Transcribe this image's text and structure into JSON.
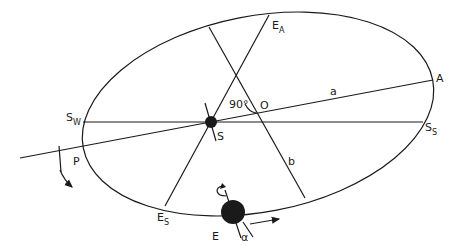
{
  "diagram": {
    "type": "orbital-geometry",
    "labels": {
      "sun": "S",
      "earth": "E",
      "center": "O",
      "aphelion": "A",
      "perihelion": "P",
      "winter_solstice": {
        "main": "S",
        "sub": "W"
      },
      "summer_solstice": {
        "main": "S",
        "sub": "S"
      },
      "autumn_equinox": {
        "main": "E",
        "sub": "A"
      },
      "spring_equinox": {
        "main": "E",
        "sub": "S"
      },
      "semi_major_axis": "a",
      "semi_minor_axis": "b",
      "right_angle": "90°",
      "obliquity": "α"
    },
    "colors": {
      "line": "#1a1a1a",
      "background": "#ffffff"
    }
  }
}
